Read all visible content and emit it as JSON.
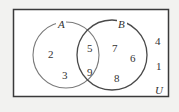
{
  "diagram": {
    "type": "venn",
    "universe_label": "U",
    "sets": [
      {
        "label": "A",
        "only": [
          "2",
          "3"
        ]
      },
      {
        "label": "B",
        "only": [
          "7",
          "6",
          "8"
        ]
      }
    ],
    "intersection": [
      "5",
      "9"
    ],
    "outside": [
      "4",
      "1"
    ],
    "colors": {
      "background": "#f2f2f0",
      "frame": "#3a3a3a",
      "circle_a": "#7a7a7a",
      "circle_b": "#4a4a4a",
      "text": "#333333"
    }
  }
}
